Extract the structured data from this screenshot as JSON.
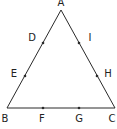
{
  "diagram": {
    "type": "triangle",
    "stroke_color": "#2a2a2a",
    "vertices": [
      {
        "name": "A",
        "x": 61,
        "y": 10,
        "label_x": 61,
        "label_y": 3
      },
      {
        "name": "B",
        "x": 7,
        "y": 108,
        "label_x": 5,
        "label_y": 119
      },
      {
        "name": "C",
        "x": 115,
        "y": 108,
        "label_x": 112,
        "label_y": 119
      }
    ],
    "points": [
      {
        "name": "D",
        "side": "AB",
        "x": 43,
        "y": 43,
        "label_x": 32,
        "label_y": 38
      },
      {
        "name": "E",
        "side": "AB",
        "x": 25,
        "y": 76,
        "label_x": 14,
        "label_y": 74
      },
      {
        "name": "F",
        "side": "BC",
        "x": 43,
        "y": 108,
        "label_x": 42,
        "label_y": 119
      },
      {
        "name": "G",
        "side": "BC",
        "x": 79,
        "y": 108,
        "label_x": 79,
        "label_y": 119
      },
      {
        "name": "H",
        "side": "AC",
        "x": 97,
        "y": 76,
        "label_x": 108,
        "label_y": 74
      },
      {
        "name": "I",
        "side": "AC",
        "x": 79,
        "y": 43,
        "label_x": 90,
        "label_y": 38
      }
    ]
  }
}
